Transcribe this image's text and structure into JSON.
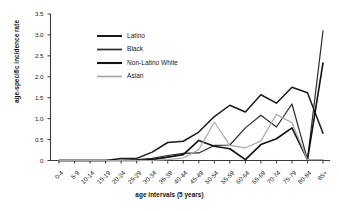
{
  "chart_data": {
    "type": "line",
    "title": "",
    "xlabel": "age intervals (5 years)",
    "ylabel": "age-specific incidence rate",
    "grid": false,
    "legend_position": "upper-left",
    "ylim": [
      0,
      3.5
    ],
    "ytick_labels": [
      "0",
      "0.5",
      "1.0",
      "1.5",
      "2.0",
      "2.5",
      "3.0",
      "3.5"
    ],
    "ytick_values": [
      0,
      0.5,
      1.0,
      1.5,
      2.0,
      2.5,
      3.0,
      3.5
    ],
    "categories": [
      "0-4",
      "5-9",
      "10-14",
      "15-19",
      "20-24",
      "25-29",
      "30-34",
      "35-39",
      "40-44",
      "45-49",
      "50-54",
      "55-59",
      "60-64",
      "65-69",
      "70-74",
      "75-79",
      "80-84",
      "85+"
    ],
    "series": [
      {
        "name": "Latino",
        "color": "#1a1a1a",
        "width": 1.5,
        "values": [
          0,
          0,
          0,
          0,
          0.05,
          0.05,
          0.2,
          0.43,
          0.46,
          0.68,
          1.05,
          1.32,
          1.16,
          1.57,
          1.37,
          1.75,
          1.62,
          0.65
        ]
      },
      {
        "name": "Black",
        "color": "#2b2b2b",
        "width": 1.2,
        "values": [
          0,
          0,
          0,
          0,
          0,
          0.02,
          0.05,
          0.12,
          0.17,
          0.18,
          0.36,
          0.37,
          0.78,
          1.08,
          0.8,
          1.35,
          0.02,
          3.1
        ]
      },
      {
        "name": "Non-Latino White",
        "color": "#111111",
        "width": 1.6,
        "values": [
          0,
          0,
          0,
          0,
          0,
          0,
          0.02,
          0.08,
          0.14,
          0.48,
          0.34,
          0.28,
          0.02,
          0.38,
          0.52,
          0.78,
          0.02,
          2.33
        ]
      },
      {
        "name": "Asian",
        "color": "#a8a8a8",
        "width": 1.2,
        "values": [
          0,
          0,
          0,
          0,
          0,
          0,
          0,
          0.02,
          0.06,
          0.26,
          0.92,
          0.36,
          0.3,
          0.47,
          1.1,
          0.9,
          0.02,
          0.02
        ]
      }
    ]
  },
  "legend": {
    "items": [
      {
        "label": "Latino"
      },
      {
        "label": "Black"
      },
      {
        "label": "Non-Latino White"
      },
      {
        "label": "Asian"
      }
    ]
  }
}
